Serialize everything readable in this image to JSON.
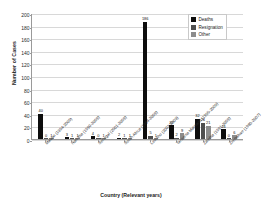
{
  "chart_data": {
    "type": "bar",
    "title": "",
    "xlabel": "Country (Relevant years)",
    "ylabel": "Number of Cases",
    "ylim": [
      0,
      200
    ],
    "yticks": [
      0,
      20,
      40,
      60,
      80,
      100,
      120,
      140,
      160,
      180,
      200
    ],
    "grid": true,
    "legend_position": "top-right",
    "categories": [
      "Malawi (1994-2009)",
      "Namibia (1990-2009)",
      "Senegal (2001-2009)",
      "South Africa (1994-2009)",
      "Lesotho (2002-2009)",
      "Tanzania Mainland (1995-2009)",
      "Zambia (1991-2009)",
      "Zimbabwe (1980-2007)"
    ],
    "series": [
      {
        "name": "Deaths",
        "values": [
          40,
          3,
          4,
          2,
          186,
          22,
          32,
          16
        ]
      },
      {
        "name": "Resignation",
        "values": [
          0,
          1,
          0,
          1,
          5,
          2,
          26,
          0
        ]
      },
      {
        "name": "Other",
        "values": [
          1,
          1,
          1,
          1,
          1,
          9,
          21,
          6
        ]
      }
    ],
    "value_labels": {
      "Deaths": [
        "40",
        "3",
        "4",
        "2",
        "186",
        "22",
        "32",
        "16"
      ],
      "Resignation": [
        "0",
        "1",
        "0",
        "1",
        "5",
        "2",
        "26",
        "0"
      ],
      "Other": [
        "1",
        "1",
        "1",
        "1",
        "1",
        "9",
        "21",
        "6"
      ]
    },
    "colors": {
      "Deaths": "#0d0d0d",
      "Resignation": "#4f4f4f",
      "Other": "#8c8c8c",
      "grid": "#d8d8d8",
      "axis": "#9a9a9a"
    }
  }
}
